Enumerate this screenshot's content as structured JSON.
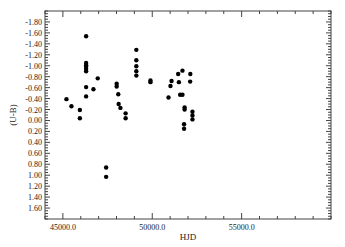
{
  "chart_data": {
    "type": "scatter",
    "title": "",
    "xlabel": "HJD",
    "ylabel": "(U-B)",
    "xlim": [
      44000,
      60000
    ],
    "ylim": [
      -2.0,
      1.8
    ],
    "y_inverted": true,
    "grid": false,
    "legend": null,
    "x_ticks": [
      45000,
      50000,
      55000
    ],
    "x_tick_labels": [
      "45000.0",
      "50000.0",
      "55000.0"
    ],
    "x_minor_step": 1000,
    "y_ticks": [
      -1.8,
      -1.6,
      -1.4,
      -1.2,
      -1.0,
      -0.8,
      -0.6,
      -0.4,
      -0.2,
      0.0,
      0.2,
      0.4,
      0.6,
      0.8,
      1.0,
      1.2,
      1.4,
      1.6
    ],
    "y_tick_labels": [
      "-1.80",
      "-1.60",
      "-1.40",
      "-1.20",
      "-1.00",
      "-0.80",
      "-0.60",
      "-0.40",
      "-0.20",
      "0.00",
      "0.20",
      "0.40",
      "0.60",
      "0.80",
      "1.00",
      "1.20",
      "1.40",
      "1.60"
    ],
    "y_minor_step": 0.05,
    "marker_color": "#000000",
    "series": [
      {
        "name": "U-B",
        "points": [
          [
            45200,
            -0.39
          ],
          [
            45480,
            -0.26
          ],
          [
            45950,
            -0.19
          ],
          [
            45950,
            -0.04
          ],
          [
            46300,
            -1.54
          ],
          [
            46300,
            -1.05
          ],
          [
            46300,
            -1.01
          ],
          [
            46300,
            -0.98
          ],
          [
            46300,
            -0.94
          ],
          [
            46300,
            -0.9
          ],
          [
            46300,
            -0.61
          ],
          [
            46300,
            -0.44
          ],
          [
            46710,
            -0.57
          ],
          [
            46950,
            -0.77
          ],
          [
            47420,
            0.86
          ],
          [
            47420,
            1.03
          ],
          [
            48010,
            -0.67
          ],
          [
            48010,
            -0.62
          ],
          [
            48100,
            -0.48
          ],
          [
            48120,
            -0.3
          ],
          [
            48220,
            -0.23
          ],
          [
            48510,
            -0.13
          ],
          [
            48510,
            -0.04
          ],
          [
            49110,
            -1.29
          ],
          [
            49110,
            -1.1
          ],
          [
            49110,
            -0.99
          ],
          [
            49110,
            -0.9
          ],
          [
            49110,
            -0.82
          ],
          [
            49900,
            -0.73
          ],
          [
            49900,
            -0.7
          ],
          [
            50910,
            -0.42
          ],
          [
            51020,
            -0.63
          ],
          [
            51080,
            -0.72
          ],
          [
            51450,
            -0.85
          ],
          [
            51490,
            -0.7
          ],
          [
            51560,
            -0.47
          ],
          [
            51690,
            -0.91
          ],
          [
            51690,
            -0.47
          ],
          [
            51780,
            0.07
          ],
          [
            51780,
            0.15
          ],
          [
            51810,
            -0.24
          ],
          [
            51810,
            -0.2
          ],
          [
            52120,
            -0.71
          ],
          [
            52130,
            -0.85
          ],
          [
            52250,
            -0.16
          ],
          [
            52250,
            -0.09
          ],
          [
            52250,
            -0.02
          ]
        ]
      }
    ]
  }
}
